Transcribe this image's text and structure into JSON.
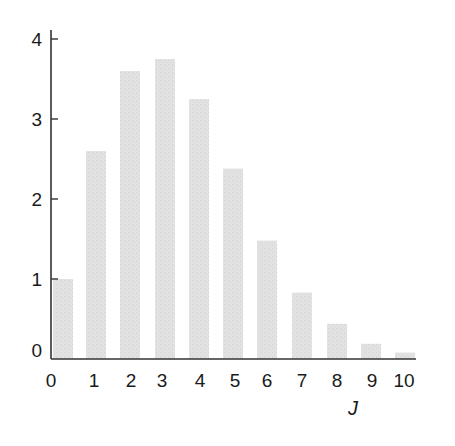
{
  "chart_data": {
    "type": "bar",
    "title": "",
    "xlabel": "J",
    "ylabel": "",
    "categories": [
      "0",
      "1",
      "2",
      "3",
      "4",
      "5",
      "6",
      "7",
      "8",
      "9",
      "10"
    ],
    "values": [
      1.0,
      2.6,
      3.6,
      3.75,
      3.25,
      2.38,
      1.48,
      0.83,
      0.44,
      0.19,
      0.08
    ],
    "ylim": [
      0,
      4
    ],
    "yticks": [
      "0",
      "1",
      "2",
      "3",
      "4"
    ],
    "grid": false,
    "legend": null,
    "bar_color": "#e0e0e0",
    "axis_color": "#333333"
  }
}
